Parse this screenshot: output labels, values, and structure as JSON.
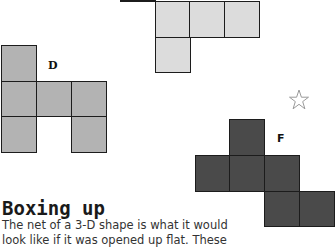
{
  "nets": {
    "top": {
      "label": "",
      "color": "#dcdcdc"
    },
    "d": {
      "label": "D",
      "color": "#b3b3b3"
    },
    "f": {
      "label": "F",
      "color": "#4a4a4a"
    }
  },
  "decoration": {
    "star_icon": "star-outline",
    "star_color": "#999999"
  },
  "article": {
    "heading": "Boxing up",
    "lines": [
      "The net of a 3-D shape is what it would",
      "look like if it was opened up flat. These"
    ]
  }
}
